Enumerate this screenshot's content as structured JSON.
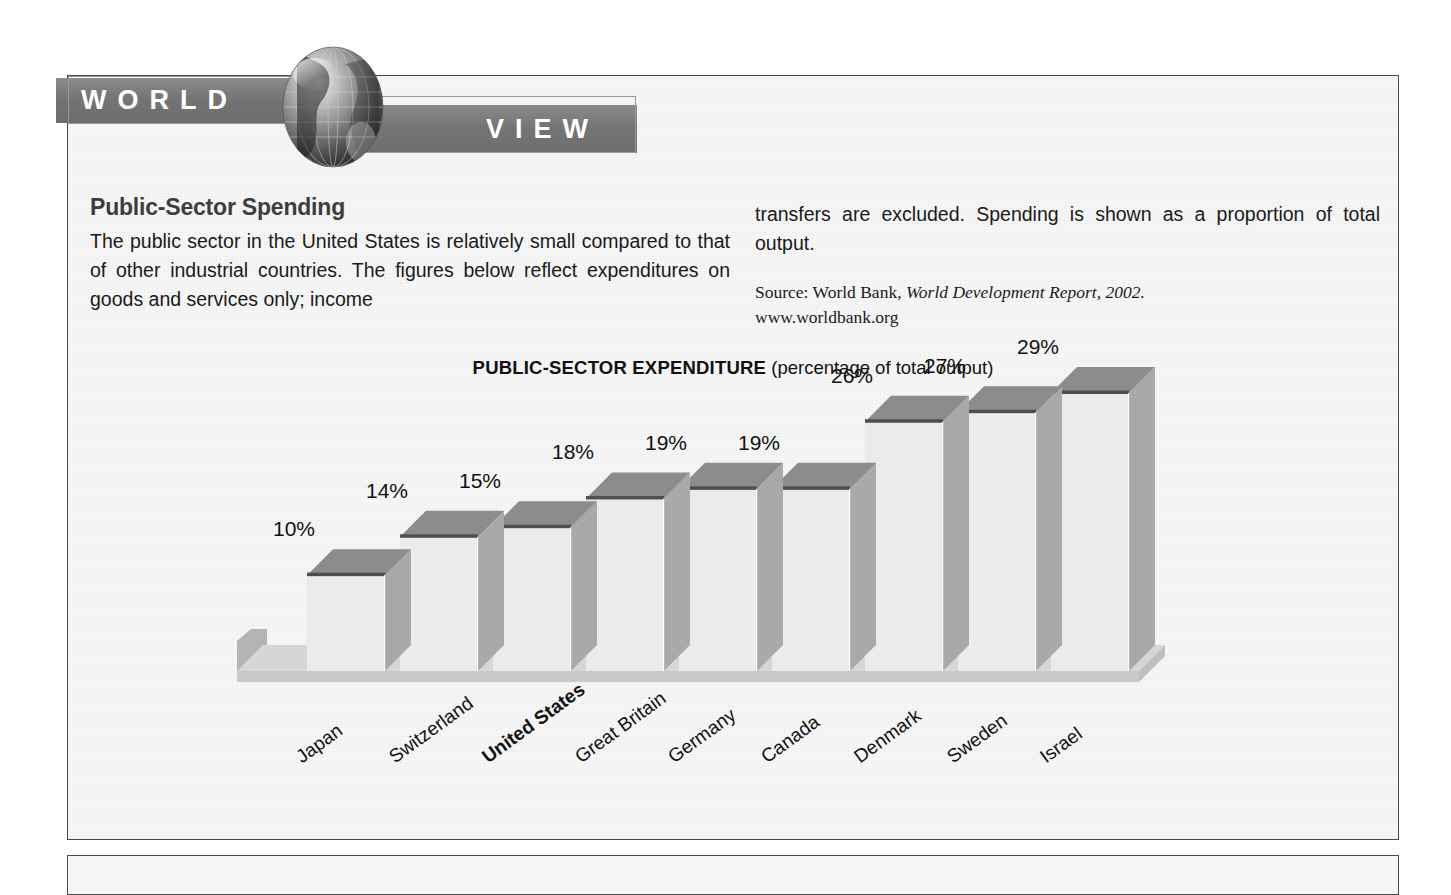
{
  "banner": {
    "word_left": "WORLD",
    "word_right": "VIEW",
    "globe_icon": "globe-icon"
  },
  "article": {
    "headline": "Public-Sector Spending",
    "body_left": "The public sector in the United States is relatively small compared to that of other industrial countries. The figures below reflect expenditures on goods and services only; income",
    "body_right": "transfers are excluded. Spending is shown as a proportion of total output.",
    "source_prefix": "Source: World Bank, ",
    "source_title": "World Development Report, 2002.",
    "source_url": "www.worldbank.org"
  },
  "chart_data": {
    "type": "bar",
    "title_strong": "PUBLIC-SECTOR EXPENDITURE",
    "title_light": "(percentage of total output)",
    "title": "PUBLIC-SECTOR EXPENDITURE (percentage of total output)",
    "xlabel": "",
    "ylabel": "percentage of total output",
    "ylim": [
      0,
      29
    ],
    "grid": false,
    "legend": "none",
    "value_suffix": "%",
    "highlight_category": "United States",
    "categories": [
      "Japan",
      "Switzerland",
      "United States",
      "Great Britain",
      "Germany",
      "Canada",
      "Denmark",
      "Sweden",
      "Israel"
    ],
    "values": [
      10,
      14,
      15,
      18,
      19,
      19,
      26,
      27,
      29
    ],
    "value_labels": [
      "10%",
      "14%",
      "15%",
      "18%",
      "19%",
      "19%",
      "26%",
      "27%",
      "29%"
    ],
    "colors": {
      "bar_front": "#ebebeb",
      "bar_side": "#a9a9a9",
      "bar_top": "#8c8c8c",
      "floor": "#c9c9c9",
      "background": "#f6f6f6",
      "banner": "#757575",
      "text": "#111111"
    }
  }
}
